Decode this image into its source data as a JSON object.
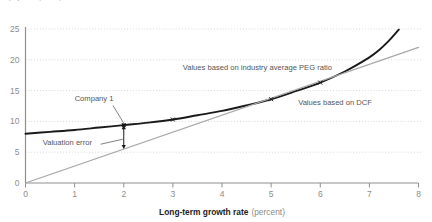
{
  "figure": {
    "clipped_header": "Equity value (dollars)",
    "background_color": "#ffffff"
  },
  "chart_data": {
    "type": "line",
    "title": "",
    "xlabel_bold": "Long-term growth rate",
    "xlabel_light": "(percent)",
    "ylabel": "",
    "xlim": [
      0,
      8
    ],
    "ylim": [
      0,
      25
    ],
    "xticks": [
      "0",
      "1",
      "2",
      "3",
      "4",
      "5",
      "6",
      "7",
      "8"
    ],
    "xtick_values": [
      0,
      1,
      2,
      3,
      4,
      5,
      6,
      7,
      8
    ],
    "yticks": [
      "0",
      "5",
      "10",
      "15",
      "20",
      "25"
    ],
    "ytick_values": [
      0,
      5,
      10,
      15,
      20,
      25
    ],
    "grid": "horizontal-dotted",
    "grid_color": "#c9c9c9",
    "axis_color": "#8f8f8f",
    "legend": "none",
    "series": [
      {
        "name": "Values based on DCF",
        "style": "curve",
        "color": "#1a1a1a",
        "width": 1.9,
        "markers": "cross",
        "x": [
          0,
          0.5,
          1,
          1.5,
          2,
          2.5,
          3,
          3.5,
          4,
          4.5,
          5,
          5.5,
          6,
          6.5,
          7,
          7.2,
          7.4,
          7.6
        ],
        "values": [
          8.0,
          8.3,
          8.6,
          9.0,
          9.4,
          9.8,
          10.3,
          11.0,
          11.7,
          12.6,
          13.6,
          14.9,
          16.3,
          18.1,
          20.4,
          21.6,
          23.1,
          24.9
        ],
        "marker_x": [
          2,
          3,
          5,
          6
        ],
        "marker_y": [
          9.4,
          10.3,
          13.6,
          16.3
        ]
      },
      {
        "name": "Values based on industry average PEG ratio",
        "style": "straight",
        "color": "#a8a8a8",
        "width": 1.3,
        "markers": "none",
        "x": [
          0,
          8
        ],
        "values": [
          0.0,
          22.0
        ]
      }
    ],
    "annotations": [
      {
        "name": "peg-label",
        "text": "Values based on industry average PEG ratio",
        "x": 3.2,
        "y": 18.4
      },
      {
        "name": "dcf-label",
        "text": "Values based on DCF",
        "x": 5.55,
        "y": 12.6
      },
      {
        "name": "company-label",
        "text": "Company 1",
        "x": 1.0,
        "y": 13.3
      },
      {
        "name": "valuation-error-label",
        "text": "Valuation error",
        "x": 0.35,
        "y": 6.2
      }
    ],
    "callouts": [
      {
        "name": "company-1-leader",
        "from_x": 1.78,
        "from_y": 12.6,
        "to_x": 2.0,
        "to_y": 9.7
      },
      {
        "name": "valuation-error-leader",
        "from_x": 1.53,
        "from_y": 6.3,
        "to_x": 1.98,
        "to_y": 7.1
      }
    ],
    "error_arrow": {
      "name": "valuation-error-arrow",
      "x": 2.0,
      "y_top": 9.4,
      "y_bottom": 5.5,
      "color": "#1a1a1a",
      "double_headed": true
    },
    "highlight_point": {
      "name": "company-1-point",
      "x": 2.0,
      "y": 9.4
    }
  }
}
